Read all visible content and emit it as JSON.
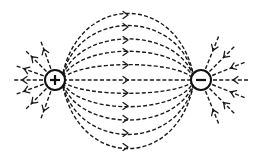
{
  "diagram": {
    "colors": {
      "line": "#1a1a1a",
      "charge_outline": "#111111",
      "background": "#ffffff"
    },
    "charges": [
      {
        "id": "positive",
        "sign": "+",
        "label": "positive-charge",
        "cx": 55,
        "cy": 80,
        "r": 10
      },
      {
        "id": "negative",
        "sign": "−",
        "label": "negative-charge",
        "cx": 201,
        "cy": 80,
        "r": 10
      }
    ],
    "connecting_lines_mid_y": [
      15,
      27,
      40,
      52,
      65,
      80,
      93,
      106,
      119,
      133,
      147
    ],
    "arrow_x": 127,
    "positive_radial_angles_deg": [
      110,
      135,
      160,
      180,
      200,
      225,
      250
    ],
    "negative_radial_angles_deg": [
      68,
      45,
      22,
      0,
      -22,
      -45,
      -68
    ]
  }
}
